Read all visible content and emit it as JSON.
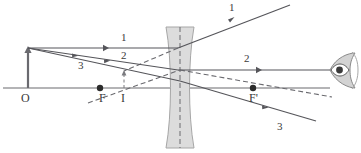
{
  "figure": {
    "type": "optics-ray-diagram",
    "width": 361,
    "height": 153,
    "background_color": "#ffffff",
    "stroke_color": "#55555a",
    "lens_fill_color": "#d9d9d9",
    "lens_edge_color": "#9a9a9a"
  },
  "labels": {
    "object_base": "O",
    "focal_left": "F",
    "focal_right": "F'",
    "image_point": "I",
    "ray1_left": "1",
    "ray1_right": "1",
    "ray2_left": "2",
    "ray2_right": "2",
    "ray3_left": "3",
    "ray3_right": "3"
  },
  "geometry": {
    "optical_axis": {
      "x1": 3,
      "y1": 88,
      "x2": 330,
      "y2": 88
    },
    "object_arrow": {
      "x": 28,
      "base_y": 88,
      "tip_y": 48
    },
    "image_arrow": {
      "x": 124,
      "base_y": 88,
      "tip_y": 71,
      "style": "dashed"
    },
    "lens": {
      "top_y": 27,
      "bottom_y": 148,
      "outer_left_x": 166,
      "outer_right_x": 194,
      "waist_left_x": 173,
      "waist_right_x": 187,
      "center_x": 180,
      "center_line_style": "dashed"
    },
    "focal_points": [
      {
        "name": "F",
        "x": 100,
        "y": 88
      },
      {
        "name": "F'",
        "x": 253,
        "y": 88
      }
    ],
    "rays": [
      {
        "id": "1",
        "kind": "solid",
        "points": [
          [
            28,
            48
          ],
          [
            178,
            48
          ],
          [
            290,
            5
          ]
        ],
        "note": "parallel ray refracted away from axis"
      },
      {
        "id": "1-virtual",
        "kind": "dashed",
        "points": [
          [
            178,
            48
          ],
          [
            124,
            71
          ]
        ],
        "note": "backward extension of ray 1 to image point"
      },
      {
        "id": "2",
        "kind": "solid",
        "points": [
          [
            28,
            48
          ],
          [
            178,
            70
          ],
          [
            330,
            70
          ]
        ],
        "note": "ray toward right focal point emerges parallel"
      },
      {
        "id": "2-virtual",
        "kind": "dashed",
        "points": [
          [
            88,
            103
          ],
          [
            180,
            70
          ],
          [
            330,
            97
          ]
        ],
        "note": "virtual ray line through F and F prime"
      },
      {
        "id": "3",
        "kind": "solid",
        "points": [
          [
            28,
            48
          ],
          [
            180,
            81
          ],
          [
            316,
            121
          ]
        ],
        "note": "ray through optical center, undeviated"
      }
    ],
    "eye": {
      "x": 332,
      "y": 70
    }
  },
  "label_positions": {
    "O": [
      22,
      94
    ],
    "F": [
      100,
      93
    ],
    "F_prime": [
      249,
      93
    ],
    "I": [
      120,
      93
    ],
    "ray1_left": [
      121,
      33
    ],
    "ray1_right": [
      229,
      3
    ],
    "ray2_left": [
      121,
      50
    ],
    "ray2_right": [
      244,
      54
    ],
    "ray3_left": [
      78,
      60
    ],
    "ray3_right": [
      277,
      122
    ]
  },
  "icons": {
    "eye": "eye-icon",
    "arrow_head": "arrow-head-icon",
    "direction_marker": "direction-arrow-icon"
  }
}
